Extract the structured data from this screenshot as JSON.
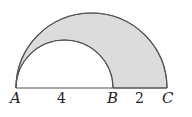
{
  "diagram": {
    "points": [
      {
        "name": "A",
        "label": "A"
      },
      {
        "name": "B",
        "label": "B"
      },
      {
        "name": "C",
        "label": "C"
      }
    ],
    "segments": [
      {
        "from": "A",
        "to": "B",
        "length_label": "4"
      },
      {
        "from": "B",
        "to": "C",
        "length_label": "2"
      }
    ],
    "shaded_region": "area between semicircle on AC and semicircle on AB",
    "colors": {
      "shade": "#dcdcdc",
      "stroke": "#555555"
    }
  }
}
